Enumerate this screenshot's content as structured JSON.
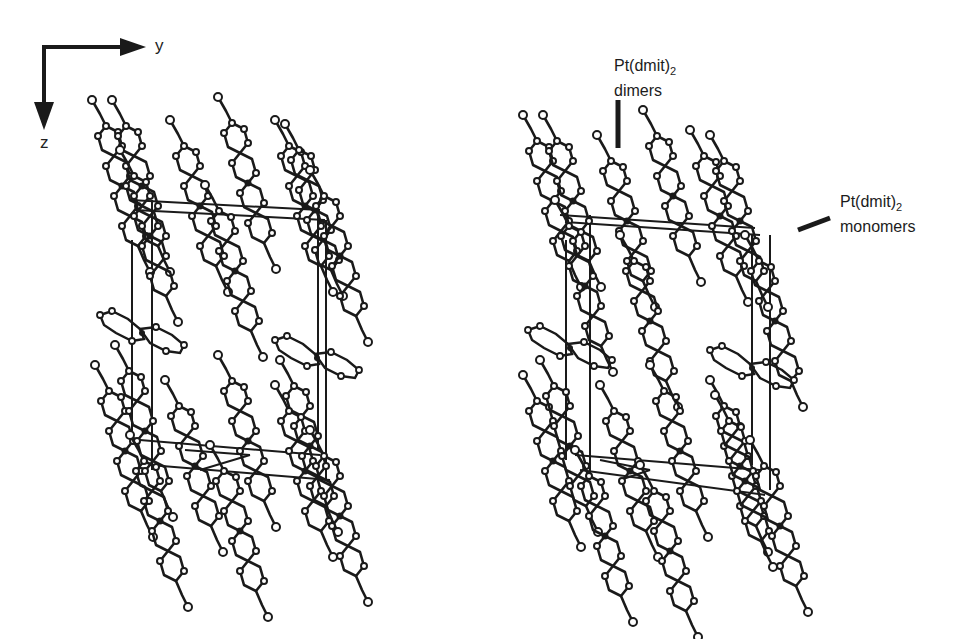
{
  "figure": {
    "axes": {
      "horizontal_label": "y",
      "vertical_label": "z"
    },
    "panels": [
      {
        "id": "left",
        "description": "Crystal packing projection with unit cell outline"
      },
      {
        "id": "right",
        "description": "Crystal packing projection with unit cell outline and annotations"
      }
    ],
    "annotations": {
      "dimers": {
        "formula": "Pt(dmit)",
        "subscript": "2",
        "label": "dimers"
      },
      "monomers": {
        "formula": "Pt(dmit)",
        "subscript": "2",
        "label": "monomers"
      }
    },
    "colors": {
      "ink": "#1a1a1a",
      "background": "#ffffff"
    }
  }
}
